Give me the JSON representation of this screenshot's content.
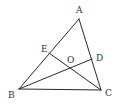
{
  "diagram": {
    "type": "geometry-triangle",
    "points": {
      "A": {
        "x": 79,
        "y": 19
      },
      "B": {
        "x": 19,
        "y": 89
      },
      "C": {
        "x": 101,
        "y": 90
      },
      "D": {
        "x": 92,
        "y": 59
      },
      "E": {
        "x": 49,
        "y": 53
      },
      "O": {
        "x": 70,
        "y": 68
      }
    },
    "segments": [
      {
        "name": "AB",
        "from": "A",
        "to": "B"
      },
      {
        "name": "AC",
        "from": "A",
        "to": "C"
      },
      {
        "name": "BC",
        "from": "B",
        "to": "C"
      },
      {
        "name": "BD",
        "from": "B",
        "to": "D"
      },
      {
        "name": "CE",
        "from": "C",
        "to": "E"
      }
    ],
    "labels": [
      {
        "text": "A",
        "x": 76,
        "y": 13
      },
      {
        "text": "B",
        "x": 8,
        "y": 98
      },
      {
        "text": "C",
        "x": 105,
        "y": 96
      },
      {
        "text": "D",
        "x": 96,
        "y": 61
      },
      {
        "text": "E",
        "x": 41,
        "y": 52
      },
      {
        "text": "O",
        "x": 67,
        "y": 63
      }
    ],
    "colors": {
      "line": "#2a2a2a",
      "label": "#333333",
      "background": "#ffffff"
    }
  }
}
